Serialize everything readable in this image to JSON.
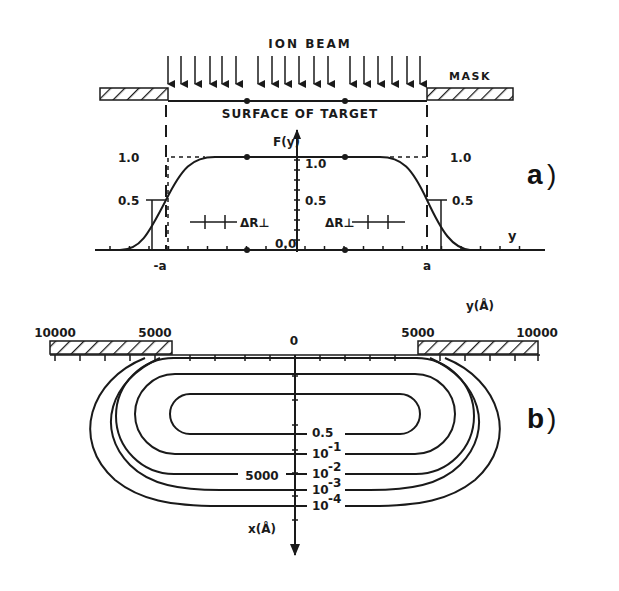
{
  "panel_a": {
    "label": "a",
    "title": "ION BEAM",
    "mask_label": "MASK",
    "surface_label": "SURFACE OF TARGET",
    "y_axis_label": "F(y)",
    "x_axis_label": "y",
    "left_levels": {
      "high": "1.0",
      "half": "0.5"
    },
    "center_levels": {
      "high": "1.0",
      "half": "0.5",
      "zero": "0.0"
    },
    "right_levels": {
      "high": "1.0",
      "half": "0.5"
    },
    "edge_left": "-a",
    "edge_right": "a",
    "delta_left": "ΔR⊥",
    "delta_right": "ΔR⊥",
    "beam_arrow_count": 18
  },
  "panel_b": {
    "label": "b",
    "y_axis_label": "y(Å)",
    "x_axis_label": "x(Å)",
    "y_ticks": [
      "10000",
      "5000",
      "0",
      "5000",
      "10000"
    ],
    "x_tick_label": "5000",
    "contours": [
      {
        "label": "0.5"
      },
      {
        "label": "10",
        "exp": "-1"
      },
      {
        "label": "10",
        "exp": "-2"
      },
      {
        "label": "10",
        "exp": "-3"
      },
      {
        "label": "10",
        "exp": "-4"
      }
    ]
  }
}
